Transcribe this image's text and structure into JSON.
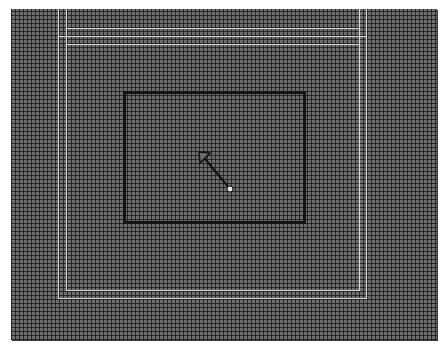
{
  "canvas": {
    "background": "#6e6e6e",
    "grid_color": "#141414",
    "grid_spacing_px": 4
  },
  "guides": {
    "color": "#d8d8d8",
    "outer_frame": {
      "left": 58,
      "right": 366,
      "top": 36,
      "bottom": 298
    },
    "inner_frame": {
      "left": 66,
      "right": 359,
      "top": 44,
      "bottom": 290
    },
    "top_segment_y": 28
  },
  "selection_rect": {
    "x": 123,
    "y": 91,
    "width": 183,
    "height": 133,
    "border_color": "#141414"
  },
  "cursor": {
    "type": "resize-nw-se-arrow",
    "from": [
      201,
      154
    ],
    "to": [
      230,
      190
    ]
  }
}
